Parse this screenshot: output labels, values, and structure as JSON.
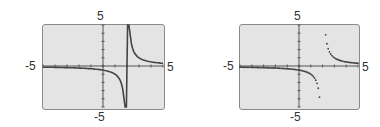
{
  "chart_data": [
    {
      "type": "line",
      "mode": "connected",
      "function": "y = 1/(x - 2)",
      "xlim": [
        -5,
        5
      ],
      "ylim": [
        -5,
        5
      ],
      "x_ticks_step": 1,
      "y_ticks_step": 1,
      "grid": false,
      "tick_labels": {
        "xmin": "-5",
        "xmax": "5",
        "ymin": "-5",
        "ymax": "5"
      },
      "vertical_asymptote_x": 2,
      "notes": "Connected mode shows a near-vertical line joining the branches at x = 2"
    },
    {
      "type": "scatter",
      "mode": "dot",
      "function": "y = 1/(x - 2)",
      "xlim": [
        -5,
        5
      ],
      "ylim": [
        -5,
        5
      ],
      "x_ticks_step": 1,
      "y_ticks_step": 1,
      "grid": false,
      "tick_labels": {
        "xmin": "-5",
        "xmax": "5",
        "ymin": "-5",
        "ymax": "5"
      },
      "vertical_asymptote_x": 2
    }
  ],
  "colors": {
    "screen": "#e4e4e4",
    "curve": "#444444",
    "axis": "#555555"
  },
  "panels": [
    {
      "ymax": "5",
      "ymin": "-5",
      "xmin": "-5",
      "xmax": "5"
    },
    {
      "ymax": "5",
      "ymin": "-5",
      "xmin": "-5",
      "xmax": "5"
    }
  ]
}
